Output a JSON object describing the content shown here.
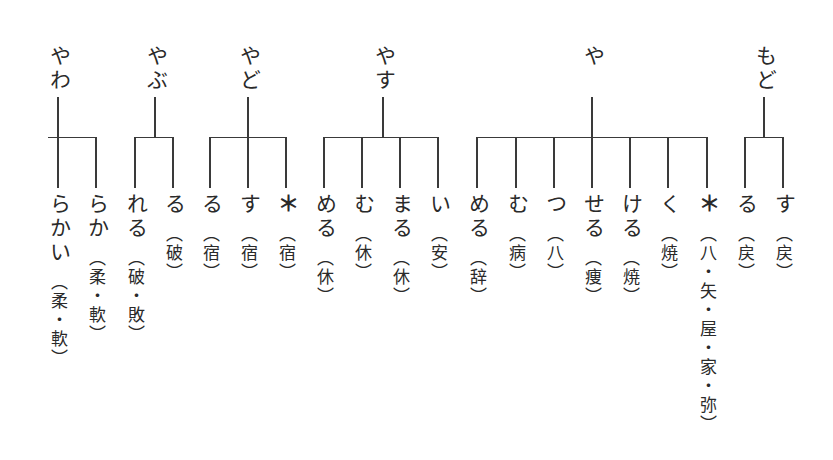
{
  "diagram": {
    "type": "tree",
    "orientation": "vertical-rl",
    "groups": [
      {
        "root": "もど",
        "root_x": 764,
        "bar": [
          745,
          783
        ],
        "children": [
          {
            "x": 783,
            "suffix": "す",
            "gloss": "（戻）",
            "marker": false
          },
          {
            "x": 745,
            "suffix": "る",
            "gloss": "（戻）",
            "marker": false
          }
        ]
      },
      {
        "root": "や",
        "root_x": 592,
        "bar": [
          477,
          707
        ],
        "children": [
          {
            "x": 707,
            "suffix": "＊",
            "gloss": "（八・矢・屋・家・弥）",
            "marker": true
          },
          {
            "x": 668,
            "suffix": "く",
            "gloss": "（焼）",
            "marker": false
          },
          {
            "x": 630,
            "suffix": "ける",
            "gloss": "（焼）",
            "marker": false
          },
          {
            "x": 592,
            "suffix": "せる",
            "gloss": "（痩）",
            "marker": false
          },
          {
            "x": 554,
            "suffix": "つ",
            "gloss": "（八）",
            "marker": false
          },
          {
            "x": 516,
            "suffix": "む",
            "gloss": "（病）",
            "marker": false
          },
          {
            "x": 477,
            "suffix": "める",
            "gloss": "（辞）",
            "marker": false
          }
        ]
      },
      {
        "root": "やす",
        "root_x": 383,
        "bar": [
          324,
          438
        ],
        "children": [
          {
            "x": 438,
            "suffix": "い",
            "gloss": "（安）",
            "marker": false
          },
          {
            "x": 400,
            "suffix": "まる",
            "gloss": "（休）",
            "marker": false
          },
          {
            "x": 362,
            "suffix": "む",
            "gloss": "（休）",
            "marker": false
          },
          {
            "x": 324,
            "suffix": "める",
            "gloss": "（休）",
            "marker": false
          }
        ]
      },
      {
        "root": "やど",
        "root_x": 248,
        "bar": [
          210,
          286
        ],
        "children": [
          {
            "x": 286,
            "suffix": "＊",
            "gloss": "（宿）",
            "marker": true
          },
          {
            "x": 248,
            "suffix": "す",
            "gloss": "（宿）",
            "marker": false
          },
          {
            "x": 210,
            "suffix": "る",
            "gloss": "（宿）",
            "marker": false
          }
        ]
      },
      {
        "root": "やぶ",
        "root_x": 155,
        "bar": [
          135,
          173
        ],
        "children": [
          {
            "x": 173,
            "suffix": "る",
            "gloss": "（破）",
            "marker": false
          },
          {
            "x": 135,
            "suffix": "れる",
            "gloss": "（破・敗）",
            "marker": false
          }
        ]
      },
      {
        "root": "やわ",
        "root_x": 58,
        "bar": [
          48,
          96
        ],
        "children": [
          {
            "x": 96,
            "suffix": "らか",
            "gloss": "（柔・軟）",
            "marker": false
          },
          {
            "x": 58,
            "suffix": "らかい",
            "gloss": "（柔・軟）",
            "marker": false
          }
        ]
      }
    ]
  },
  "colors": {
    "ink": "#2a2a2a",
    "line": "#3a3a3a",
    "background": "#ffffff"
  }
}
